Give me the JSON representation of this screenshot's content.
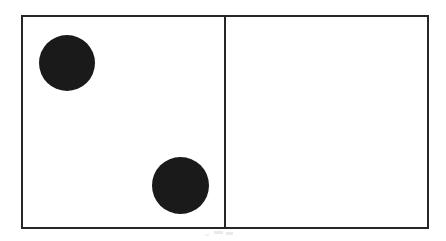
{
  "figure": {
    "title": "",
    "caption": "",
    "background_color": "#ffffff",
    "stroke_color": "#262626",
    "fill_color": "#1a1a1a",
    "frame": {
      "x": 21,
      "y": 15,
      "width": 408,
      "height": 214,
      "border_width": 2
    },
    "divider": {
      "orientation": "vertical",
      "x": 224,
      "width": 2
    }
  },
  "panels": [
    {
      "name": "left-panel",
      "label": "",
      "x": 23,
      "y": 17,
      "width": 201,
      "height": 210,
      "shape_count": 2
    },
    {
      "name": "right-panel",
      "label": "",
      "x": 226,
      "y": 17,
      "width": 201,
      "height": 210,
      "shape_count": 0
    }
  ],
  "shapes": [
    {
      "id": "dot-1",
      "type": "circle",
      "panel": "left-panel",
      "label": "",
      "center_x": 67,
      "center_y": 63,
      "diameter": 56,
      "radius": 28,
      "color": "#1a1a1a"
    },
    {
      "id": "dot-2",
      "type": "circle",
      "panel": "left-panel",
      "label": "",
      "center_x": 180,
      "center_y": 185,
      "diameter": 57,
      "radius": 28.5,
      "color": "#1a1a1a"
    }
  ],
  "artifacts": {
    "note": "faint gray scan speckles below the bottom rule",
    "color": "#d8d8d8"
  }
}
